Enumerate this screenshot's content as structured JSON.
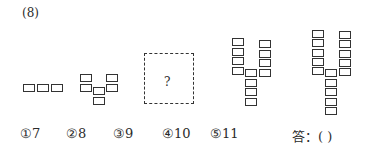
{
  "question": {
    "number": "(8)",
    "unknown_mark": "?",
    "options": [
      {
        "label": "①7"
      },
      {
        "label": "②8"
      },
      {
        "label": "③9"
      },
      {
        "label": "④10"
      },
      {
        "label": "⑤11"
      }
    ],
    "answer_prompt": "答：(        )"
  },
  "figures": [
    {
      "name": "figure-1",
      "cells": [
        [
          23,
          84
        ],
        [
          37,
          84
        ],
        [
          51,
          84
        ]
      ]
    },
    {
      "name": "figure-2",
      "cells": [
        [
          80,
          74
        ],
        [
          80,
          84
        ],
        [
          93,
          87
        ],
        [
          93,
          97
        ],
        [
          106,
          74
        ],
        [
          106,
          84
        ]
      ]
    },
    {
      "name": "figure-4",
      "cells": [
        [
          232,
          38
        ],
        [
          232,
          47.5
        ],
        [
          232,
          57
        ],
        [
          232,
          66.5
        ],
        [
          245,
          69
        ],
        [
          245,
          78.5
        ],
        [
          245,
          88
        ],
        [
          245,
          97.5
        ],
        [
          259,
          40
        ],
        [
          259,
          49.5
        ],
        [
          259,
          59
        ],
        [
          259,
          68.5
        ]
      ]
    },
    {
      "name": "figure-5",
      "cells": [
        [
          312,
          30
        ],
        [
          312,
          39.3
        ],
        [
          312,
          48.6
        ],
        [
          312,
          57.9
        ],
        [
          312,
          67.2
        ],
        [
          325,
          69
        ],
        [
          325,
          78.5
        ],
        [
          325,
          88
        ],
        [
          325,
          97.5
        ],
        [
          325,
          107
        ],
        [
          339,
          31
        ],
        [
          339,
          40.3
        ],
        [
          339,
          49.6
        ],
        [
          339,
          58.9
        ],
        [
          339,
          68.2
        ]
      ]
    }
  ],
  "layout": {
    "option_x": [
      20,
      66,
      113,
      162,
      210,
      292
    ]
  }
}
